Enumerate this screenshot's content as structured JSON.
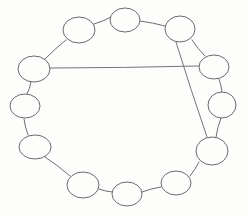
{
  "figure": {
    "background_color": "#fdfdfc",
    "stroke_color": "#6e6e72",
    "node_fill": "#fdfdfc",
    "node_stroke": "#6a6a6e",
    "width": 249,
    "height": 215
  },
  "graph": {
    "node_count": 13,
    "ring_edge_count": 13,
    "chord_count": 2,
    "nodes": [
      {
        "id": "n1",
        "label": "",
        "cx": 125,
        "cy": 20,
        "rx": 15,
        "ry": 12
      },
      {
        "id": "n2",
        "label": "",
        "cx": 180,
        "cy": 29,
        "rx": 15,
        "ry": 13
      },
      {
        "id": "n3",
        "label": "",
        "cx": 214,
        "cy": 67,
        "rx": 15,
        "ry": 12
      },
      {
        "id": "n4",
        "label": "",
        "cx": 222,
        "cy": 105,
        "rx": 14,
        "ry": 13
      },
      {
        "id": "n5",
        "label": "",
        "cx": 212,
        "cy": 151,
        "rx": 16,
        "ry": 14
      },
      {
        "id": "n6",
        "label": "",
        "cx": 176,
        "cy": 183,
        "rx": 15,
        "ry": 12
      },
      {
        "id": "n7",
        "label": "",
        "cx": 127,
        "cy": 194,
        "rx": 15,
        "ry": 12
      },
      {
        "id": "n8",
        "label": "",
        "cx": 83,
        "cy": 185,
        "rx": 16,
        "ry": 13
      },
      {
        "id": "n9",
        "label": "",
        "cx": 35,
        "cy": 147,
        "rx": 16,
        "ry": 12
      },
      {
        "id": "n10",
        "label": "",
        "cx": 25,
        "cy": 106,
        "rx": 15,
        "ry": 12
      },
      {
        "id": "n11",
        "label": "",
        "cx": 34,
        "cy": 69,
        "rx": 16,
        "ry": 13
      },
      {
        "id": "n12",
        "label": "",
        "cx": 79,
        "cy": 30,
        "rx": 16,
        "ry": 13
      },
      {
        "id": "n13",
        "label": "",
        "cx": 125,
        "cy": 20,
        "rx": 15,
        "ry": 12
      }
    ],
    "ring_edges": [
      {
        "from": "n12",
        "to": "n1",
        "x1": 94,
        "y1": 24,
        "x2": 111,
        "y2": 17
      },
      {
        "from": "n1",
        "to": "n2",
        "x1": 140,
        "y1": 21,
        "x2": 165,
        "y2": 26
      },
      {
        "from": "n2",
        "to": "n3",
        "x1": 192,
        "y1": 40,
        "x2": 205,
        "y2": 56
      },
      {
        "from": "n3",
        "to": "n4",
        "x1": 219,
        "y1": 79,
        "x2": 222,
        "y2": 92
      },
      {
        "from": "n4",
        "to": "n5",
        "x1": 221,
        "y1": 118,
        "x2": 216,
        "y2": 137
      },
      {
        "from": "n5",
        "to": "n6",
        "x1": 199,
        "y1": 162,
        "x2": 190,
        "y2": 176
      },
      {
        "from": "n6",
        "to": "n7",
        "x1": 161,
        "y1": 187,
        "x2": 142,
        "y2": 192
      },
      {
        "from": "n7",
        "to": "n8",
        "x1": 112,
        "y1": 192,
        "x2": 99,
        "y2": 189
      },
      {
        "from": "n8",
        "to": "n9",
        "x1": 70,
        "y1": 176,
        "x2": 45,
        "y2": 157
      },
      {
        "from": "n9",
        "to": "n10",
        "x1": 28,
        "y1": 135,
        "x2": 24,
        "y2": 119
      },
      {
        "from": "n10",
        "to": "n11",
        "x1": 27,
        "y1": 94,
        "x2": 31,
        "y2": 82
      },
      {
        "from": "n11",
        "to": "n12",
        "x1": 45,
        "y1": 59,
        "x2": 66,
        "y2": 40
      }
    ],
    "chords": [
      {
        "name": "horizontal-chord",
        "from": "n11",
        "to": "n3",
        "x1": 50,
        "y1": 68,
        "x2": 199,
        "y2": 66
      },
      {
        "name": "diagonal-chord",
        "from": "n2",
        "to": "n5",
        "x1": 176,
        "y1": 42,
        "x2": 207,
        "y2": 137
      }
    ]
  }
}
